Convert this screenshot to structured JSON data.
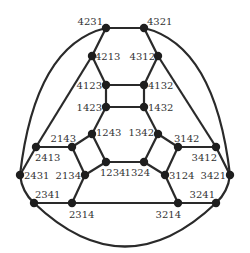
{
  "diagram": {
    "nodes": [
      {
        "id": "4231",
        "label": "4231"
      },
      {
        "id": "4321",
        "label": "4321"
      },
      {
        "id": "4213",
        "label": "4213"
      },
      {
        "id": "4312",
        "label": "4312"
      },
      {
        "id": "4123",
        "label": "4123"
      },
      {
        "id": "4132",
        "label": "4132"
      },
      {
        "id": "1423",
        "label": "1423"
      },
      {
        "id": "1432",
        "label": "1432"
      },
      {
        "id": "1243",
        "label": "1243"
      },
      {
        "id": "1342",
        "label": "1342"
      },
      {
        "id": "2143",
        "label": "2143"
      },
      {
        "id": "3142",
        "label": "3142"
      },
      {
        "id": "2413",
        "label": "2413"
      },
      {
        "id": "3412",
        "label": "3412"
      },
      {
        "id": "1234",
        "label": "1234"
      },
      {
        "id": "1324",
        "label": "1324"
      },
      {
        "id": "2134",
        "label": "2134"
      },
      {
        "id": "3124",
        "label": "3124"
      },
      {
        "id": "2431",
        "label": "2431"
      },
      {
        "id": "3421",
        "label": "3421"
      },
      {
        "id": "2341",
        "label": "2341"
      },
      {
        "id": "3241",
        "label": "3241"
      },
      {
        "id": "2314",
        "label": "2314"
      },
      {
        "id": "3214",
        "label": "3214"
      }
    ],
    "edges": [
      [
        "4231",
        "4321"
      ],
      [
        "4231",
        "4213"
      ],
      [
        "4321",
        "4312"
      ],
      [
        "4213",
        "4123"
      ],
      [
        "4312",
        "4132"
      ],
      [
        "4123",
        "4132"
      ],
      [
        "4123",
        "1423"
      ],
      [
        "4132",
        "1432"
      ],
      [
        "1423",
        "1432"
      ],
      [
        "1423",
        "1243"
      ],
      [
        "1432",
        "1342"
      ],
      [
        "1243",
        "2143"
      ],
      [
        "1243",
        "1234"
      ],
      [
        "1342",
        "3142"
      ],
      [
        "1342",
        "1324"
      ],
      [
        "1234",
        "1324"
      ],
      [
        "1234",
        "2134"
      ],
      [
        "1324",
        "3124"
      ],
      [
        "2143",
        "2413"
      ],
      [
        "2143",
        "2134"
      ],
      [
        "3142",
        "3412"
      ],
      [
        "3142",
        "3124"
      ],
      [
        "2413",
        "4213"
      ],
      [
        "3412",
        "4312"
      ],
      [
        "2413",
        "2431"
      ],
      [
        "3412",
        "3421"
      ],
      [
        "2134",
        "2314"
      ],
      [
        "3124",
        "3214"
      ],
      [
        "2341",
        "2314"
      ],
      [
        "2314",
        "3214"
      ],
      [
        "3214",
        "3241"
      ],
      [
        "2431",
        "2341"
      ],
      [
        "3421",
        "3241"
      ],
      [
        "4231",
        "2431"
      ],
      [
        "4321",
        "3421"
      ],
      [
        "2341",
        "3241"
      ]
    ]
  }
}
